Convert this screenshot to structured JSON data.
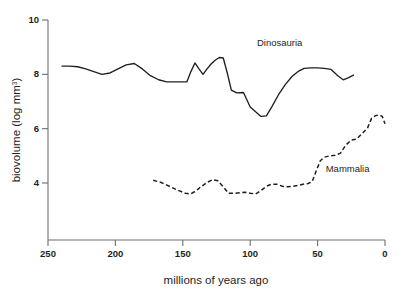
{
  "chart_data": {
    "type": "line",
    "title": "",
    "xlabel": "millions of years ago",
    "ylabel": "biovolume (log mm",
    "ylabel_sup": "3",
    "ylabel_tail": ")",
    "xlim": [
      250,
      0
    ],
    "ylim": [
      2.8,
      10
    ],
    "x_reversed": true,
    "grid": false,
    "legend": "inline-annotations",
    "xticks": [
      250,
      200,
      150,
      100,
      50,
      0
    ],
    "xtick_labels": [
      "250",
      "200",
      "150",
      "100",
      "50",
      "0"
    ],
    "yticks": [
      10,
      8,
      6,
      4
    ],
    "ytick_labels": [
      "10",
      "8",
      "6",
      "4"
    ],
    "series": [
      {
        "name": "Dinosauria",
        "style": "solid",
        "color": "#231f20",
        "label_x": 95,
        "label_y": 9.05,
        "points": [
          [
            240,
            8.3
          ],
          [
            234,
            8.3
          ],
          [
            228,
            8.28
          ],
          [
            222,
            8.2
          ],
          [
            216,
            8.1
          ],
          [
            210,
            8.0
          ],
          [
            204,
            8.05
          ],
          [
            198,
            8.2
          ],
          [
            192,
            8.35
          ],
          [
            186,
            8.4
          ],
          [
            180,
            8.2
          ],
          [
            174,
            7.95
          ],
          [
            168,
            7.8
          ],
          [
            162,
            7.72
          ],
          [
            156,
            7.72
          ],
          [
            150,
            7.72
          ],
          [
            147,
            7.72
          ],
          [
            144,
            8.1
          ],
          [
            141,
            8.42
          ],
          [
            138,
            8.2
          ],
          [
            135,
            8.0
          ],
          [
            132,
            8.2
          ],
          [
            129,
            8.38
          ],
          [
            126,
            8.52
          ],
          [
            123,
            8.62
          ],
          [
            120,
            8.6
          ],
          [
            117,
            8.05
          ],
          [
            114,
            7.42
          ],
          [
            110,
            7.32
          ],
          [
            105,
            7.33
          ],
          [
            100,
            6.8
          ],
          [
            96,
            6.62
          ],
          [
            92,
            6.45
          ],
          [
            88,
            6.47
          ],
          [
            84,
            6.8
          ],
          [
            79,
            7.25
          ],
          [
            74,
            7.62
          ],
          [
            69,
            7.92
          ],
          [
            64,
            8.12
          ],
          [
            60,
            8.22
          ],
          [
            55,
            8.24
          ],
          [
            50,
            8.24
          ],
          [
            45,
            8.22
          ],
          [
            40,
            8.18
          ],
          [
            35,
            7.95
          ],
          [
            31,
            7.8
          ],
          [
            27,
            7.88
          ],
          [
            23,
            7.98
          ]
        ]
      },
      {
        "name": "Mammalia",
        "style": "dashed",
        "color": "#231f20",
        "label_x": 44,
        "label_y": 4.42,
        "points": [
          [
            172,
            4.1
          ],
          [
            166,
            4.02
          ],
          [
            160,
            3.88
          ],
          [
            154,
            3.74
          ],
          [
            148,
            3.62
          ],
          [
            144,
            3.6
          ],
          [
            140,
            3.72
          ],
          [
            136,
            3.88
          ],
          [
            132,
            4.02
          ],
          [
            128,
            4.12
          ],
          [
            124,
            4.08
          ],
          [
            120,
            3.86
          ],
          [
            116,
            3.62
          ],
          [
            112,
            3.62
          ],
          [
            108,
            3.64
          ],
          [
            104,
            3.66
          ],
          [
            100,
            3.62
          ],
          [
            96,
            3.6
          ],
          [
            92,
            3.72
          ],
          [
            88,
            3.88
          ],
          [
            84,
            3.96
          ],
          [
            80,
            3.95
          ],
          [
            76,
            3.88
          ],
          [
            72,
            3.86
          ],
          [
            68,
            3.88
          ],
          [
            64,
            3.92
          ],
          [
            60,
            3.96
          ],
          [
            57,
            3.98
          ],
          [
            54,
            4.05
          ],
          [
            51,
            4.45
          ],
          [
            48,
            4.82
          ],
          [
            45,
            4.95
          ],
          [
            41,
            5.0
          ],
          [
            37,
            5.02
          ],
          [
            33,
            5.1
          ],
          [
            29,
            5.4
          ],
          [
            25,
            5.58
          ],
          [
            21,
            5.62
          ],
          [
            17,
            5.82
          ],
          [
            13,
            6.02
          ],
          [
            10,
            6.38
          ],
          [
            7,
            6.48
          ],
          [
            4,
            6.5
          ],
          [
            2,
            6.45
          ],
          [
            0,
            6.18
          ]
        ]
      }
    ]
  },
  "axis_titles": {
    "x": "millions of years ago"
  }
}
